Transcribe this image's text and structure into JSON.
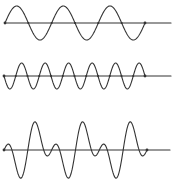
{
  "figure": {
    "name": "wave-superposition-figure",
    "type": "waveform-diagram",
    "background": "#ffffff",
    "stroke_color": "#333333",
    "stroke_width": 1.1,
    "endpoint_dot_radius": 1.4,
    "crossing_dot_radius": 1.0,
    "canvas": {
      "width": 176,
      "height": 184
    },
    "waves": [
      {
        "name": "top-sine-wave",
        "axis_y": 23,
        "curve_x_start": 5,
        "curve_x_end": 145,
        "line_x_start": 5,
        "line_x_end": 171,
        "components": [
          {
            "cycles": 3,
            "amplitude": 17,
            "sign": 1
          }
        ],
        "crossing_dots": true,
        "endpoint_dots": true
      },
      {
        "name": "middle-sine-wave",
        "axis_y": 76,
        "curve_x_start": 4,
        "curve_x_end": 145,
        "line_x_start": 4,
        "line_x_end": 171,
        "components": [
          {
            "cycles": 6,
            "amplitude": 13,
            "sign": -1
          }
        ],
        "crossing_dots": true,
        "endpoint_dots": true
      },
      {
        "name": "bottom-composite-wave",
        "axis_y": 150,
        "curve_x_start": 4,
        "curve_x_end": 147,
        "line_x_start": 4,
        "line_x_end": 170,
        "components": [
          {
            "cycles": 3,
            "amplitude": 16,
            "sign": -1
          },
          {
            "cycles": 6,
            "amplitude": 16,
            "sign": 1
          }
        ],
        "crossing_dots": false,
        "endpoint_dots": true
      }
    ]
  }
}
